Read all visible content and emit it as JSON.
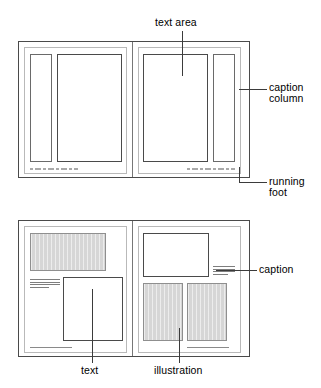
{
  "figure": {
    "type": "page-layout-diagram",
    "background_color": "#ffffff",
    "line_color": "#4a4a4a",
    "illustration_fill": "#d6d6d6"
  },
  "spread_top": {
    "name": "text-with-caption-column-spread",
    "left_page": {
      "caption_column": "caption column",
      "text_area": "text area",
      "running_foot": "running foot"
    },
    "right_page": {
      "text_area": "text area",
      "caption_column": "caption column",
      "running_foot": "running foot"
    }
  },
  "spread_bottom": {
    "name": "text-and-illustration-spread",
    "left_page": {
      "illustration": "illustration",
      "caption": "caption",
      "text": "text",
      "running_foot": "running foot"
    },
    "right_page": {
      "text": "text",
      "caption": "caption",
      "illustration": "illustration",
      "running_foot": "running foot"
    }
  },
  "labels": {
    "text_area": "text area",
    "caption_column_line1": "caption",
    "caption_column_line2": "column",
    "running_foot_line1": "running",
    "running_foot_line2": "foot",
    "caption": "caption",
    "text": "text",
    "illustration": "illustration"
  }
}
